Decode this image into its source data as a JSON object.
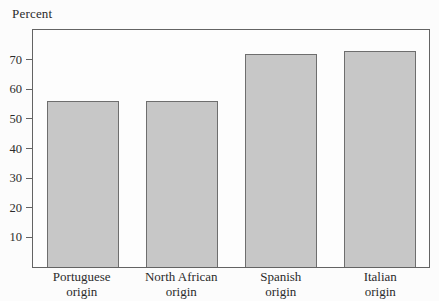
{
  "chart_data": {
    "type": "bar",
    "title": "",
    "ylabel": "Percent",
    "xlabel": "",
    "categories": [
      "Portuguese origin",
      "North African origin",
      "Spanish origin",
      "Italian origin"
    ],
    "category_label_lines": [
      [
        "Portuguese",
        "origin"
      ],
      [
        "North African",
        "origin"
      ],
      [
        "Spanish",
        "origin"
      ],
      [
        "Italian",
        "origin"
      ]
    ],
    "values": [
      56,
      56,
      72,
      73
    ],
    "ylim": [
      0,
      80
    ],
    "yticks": [
      10,
      20,
      30,
      40,
      50,
      60,
      70
    ],
    "grid": false,
    "legend": "none",
    "colors": {
      "bar_fill": "#c7c7c7",
      "bar_border": "#6e6e6e",
      "axis_frame": "#636363",
      "text": "#2b2b2b",
      "background": "#fcfcfc"
    }
  }
}
